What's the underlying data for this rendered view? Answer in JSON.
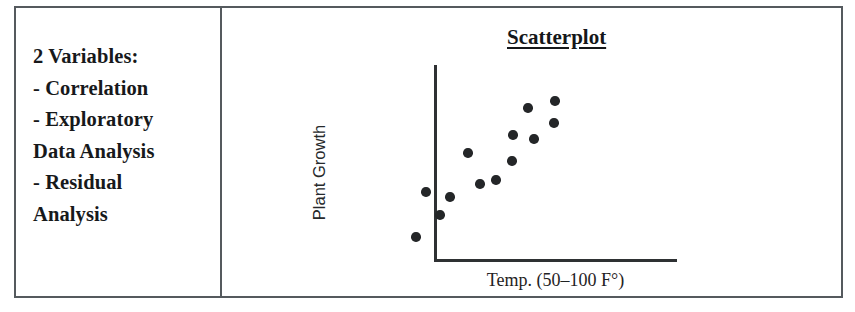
{
  "table": {
    "left_cell": {
      "lines": [
        "2 Variables:",
        "- Correlation",
        "- Exploratory",
        "Data Analysis",
        "- Residual",
        "Analysis"
      ]
    }
  },
  "chart_data": {
    "type": "scatter",
    "title": "Scatterplot",
    "xlabel": "Temp. (50–100 F°)",
    "ylabel": "Plant Growth",
    "grid": false,
    "legend": null,
    "axis_style": "L-shaped axes, no tick marks, no tick labels",
    "xlim": [
      50,
      100
    ],
    "ylim": [
      0,
      10
    ],
    "point_color": "#242628",
    "axis_color": "#2e3133",
    "n_points": 13,
    "points": [
      {
        "x": 52.5,
        "y": 1.2
      },
      {
        "x": 54.9,
        "y": 3.5
      },
      {
        "x": 58.2,
        "y": 2.4
      },
      {
        "x": 60.6,
        "y": 3.3
      },
      {
        "x": 65.0,
        "y": 5.6
      },
      {
        "x": 67.9,
        "y": 4.0
      },
      {
        "x": 71.8,
        "y": 4.2
      },
      {
        "x": 75.7,
        "y": 5.2
      },
      {
        "x": 75.9,
        "y": 6.5
      },
      {
        "x": 79.6,
        "y": 7.8
      },
      {
        "x": 81.0,
        "y": 6.3
      },
      {
        "x": 86.2,
        "y": 8.2
      },
      {
        "x": 86.0,
        "y": 7.1
      }
    ],
    "pixel_points": [
      {
        "cx": 194,
        "cy": 229
      },
      {
        "cx": 204,
        "cy": 184
      },
      {
        "cx": 218,
        "cy": 207
      },
      {
        "cx": 228,
        "cy": 189
      },
      {
        "cx": 246,
        "cy": 145
      },
      {
        "cx": 258,
        "cy": 176
      },
      {
        "cx": 274,
        "cy": 172
      },
      {
        "cx": 290,
        "cy": 153
      },
      {
        "cx": 291,
        "cy": 127
      },
      {
        "cx": 306,
        "cy": 100
      },
      {
        "cx": 312,
        "cy": 131
      },
      {
        "cx": 333,
        "cy": 93
      },
      {
        "cx": 332,
        "cy": 115
      }
    ]
  }
}
